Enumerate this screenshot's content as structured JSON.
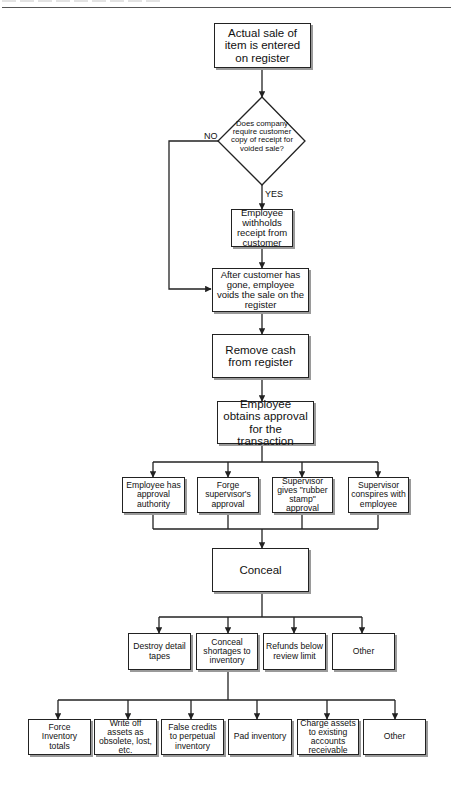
{
  "diagram": {
    "type": "flowchart",
    "nodes": {
      "start": "Actual sale of item is entered on register",
      "decision": "Does company require customer copy of receipt for voided sale?",
      "decision_no": "NO",
      "decision_yes": "YES",
      "withhold": "Employee withholds receipt from customer",
      "void": "After customer has gone, employee voids the sale on the register",
      "remove_cash": "Remove cash from register",
      "approval": "Employee obtains approval for the transaction",
      "approval_methods": [
        "Employee has approval authority",
        "Forge supervisor's approval",
        "Supervisor gives \"rubber stamp\" approval",
        "Supervisor conspires with employee"
      ],
      "conceal": "Conceal",
      "conceal_methods": [
        "Destroy detail tapes",
        "Conceal shortages to inventory",
        "Refunds below review limit",
        "Other"
      ],
      "inventory_methods": [
        "Force Inventory totals",
        "Write off assets as obsolete, lost, etc.",
        "False credits to perpetual inventory",
        "Pad inventory",
        "Charge assets to existing accounts receivable",
        "Other"
      ]
    },
    "colors": {
      "line": "#222222",
      "shadow": "#9a9a9a",
      "background": "#ffffff"
    }
  }
}
